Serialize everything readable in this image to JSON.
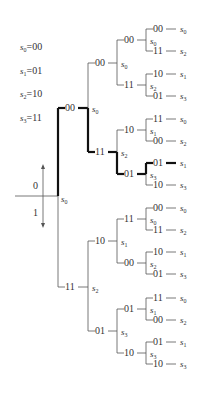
{
  "legend": [
    {
      "state": "s",
      "sub": "0",
      "code": "=00"
    },
    {
      "state": "s",
      "sub": "1",
      "code": "=01"
    },
    {
      "state": "s",
      "sub": "2",
      "code": "=10"
    },
    {
      "state": "s",
      "sub": "3",
      "code": "=11"
    }
  ],
  "axis": {
    "up_label": "0",
    "down_label": "1"
  },
  "root": {
    "state": "s",
    "sub": "0"
  },
  "tree": {
    "l1": [
      {
        "code": "00",
        "state": "s",
        "sub": "0"
      },
      {
        "code": "11",
        "state": "s",
        "sub": "2"
      }
    ],
    "l2": [
      {
        "code": "00",
        "state": "s",
        "sub": "0"
      },
      {
        "code": "11",
        "state": "s",
        "sub": "2"
      },
      {
        "code": "10",
        "state": "s",
        "sub": "1"
      },
      {
        "code": "01",
        "state": "s",
        "sub": "3"
      }
    ],
    "l3": [
      {
        "code": "00",
        "state": "s",
        "sub": "0"
      },
      {
        "code": "11",
        "state": "s",
        "sub": "2"
      },
      {
        "code": "10",
        "state": "s",
        "sub": "1"
      },
      {
        "code": "01",
        "state": "s",
        "sub": "3"
      },
      {
        "code": "11",
        "state": "s",
        "sub": "0"
      },
      {
        "code": "00",
        "state": "s",
        "sub": "2"
      },
      {
        "code": "01",
        "state": "s",
        "sub": "1"
      },
      {
        "code": "10",
        "state": "s",
        "sub": "3"
      }
    ],
    "l4": [
      {
        "code": "00",
        "state": "s",
        "sub": "0"
      },
      {
        "code": "11",
        "state": "s",
        "sub": "2"
      },
      {
        "code": "10",
        "state": "s",
        "sub": "1"
      },
      {
        "code": "01",
        "state": "s",
        "sub": "3"
      },
      {
        "code": "11",
        "state": "s",
        "sub": "0"
      },
      {
        "code": "00",
        "state": "s",
        "sub": "2"
      },
      {
        "code": "01",
        "state": "s",
        "sub": "1"
      },
      {
        "code": "10",
        "state": "s",
        "sub": "3"
      },
      {
        "code": "00",
        "state": "s",
        "sub": "0"
      },
      {
        "code": "11",
        "state": "s",
        "sub": "2"
      },
      {
        "code": "10",
        "state": "s",
        "sub": "1"
      },
      {
        "code": "01",
        "state": "s",
        "sub": "3"
      },
      {
        "code": "11",
        "state": "s",
        "sub": "0"
      },
      {
        "code": "00",
        "state": "s",
        "sub": "2"
      },
      {
        "code": "01",
        "state": "s",
        "sub": "1"
      },
      {
        "code": "10",
        "state": "s",
        "sub": "3"
      }
    ]
  },
  "highlight_path": [
    "00",
    "11",
    "01",
    "01"
  ]
}
